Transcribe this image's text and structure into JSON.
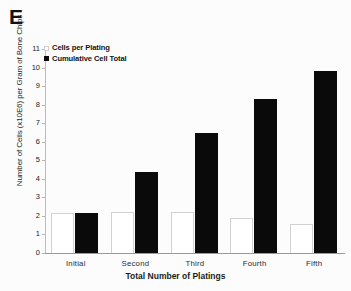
{
  "figure": {
    "panel_letter": "E"
  },
  "chart_data": {
    "type": "bar",
    "title": "",
    "categories": [
      "Initial",
      "Second",
      "Third",
      "Fourth",
      "Fifth"
    ],
    "series": [
      {
        "name": "Cells per Plating",
        "values": [
          2.15,
          2.2,
          2.2,
          1.9,
          1.55
        ],
        "style": "open",
        "color": "#ffffff"
      },
      {
        "name": "Cumulative Cell Total",
        "values": [
          2.15,
          4.35,
          6.45,
          8.3,
          9.8
        ],
        "style": "filled",
        "color": "#0a0a0a"
      }
    ],
    "xlabel": "Total Number of Platings",
    "ylabel": "Number of Cells (x10E6) per Gram of Bone Chips",
    "ylim": [
      0,
      11
    ],
    "yticks": [
      0,
      1,
      2,
      3,
      4,
      5,
      6,
      7,
      8,
      9,
      10,
      11
    ],
    "ytick_labels": [
      "0",
      "1",
      "2",
      "3",
      "4",
      "5",
      "6",
      "7",
      "8",
      "9",
      "10",
      "11"
    ],
    "grid": false,
    "legend_position": "top-left"
  }
}
